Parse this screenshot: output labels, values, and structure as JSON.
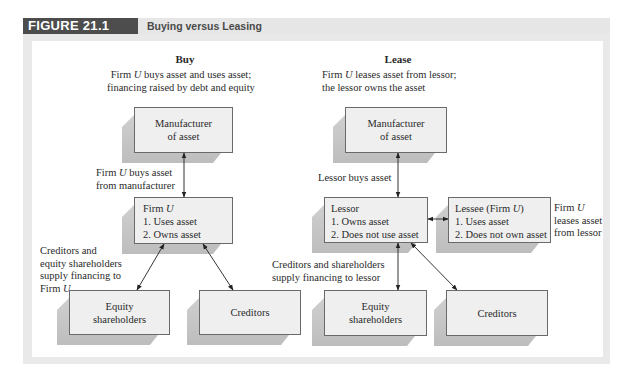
{
  "figure": {
    "label": "FIGURE 21.1",
    "title": "Buying versus Leasing"
  },
  "buy": {
    "heading": "Buy",
    "caption_top": [
      "Firm U buys asset and uses asset;",
      "financing raised by debt and equity"
    ],
    "manufacturer": [
      "Manufacturer",
      "of asset"
    ],
    "arrow_label": [
      "Firm U buys asset",
      "from manufacturer"
    ],
    "firm": [
      "Firm U",
      "1. Uses asset",
      "2. Owns asset"
    ],
    "financing_label": [
      "Creditors and",
      "equity shareholders",
      "supply financing to",
      "Firm U"
    ],
    "equity": [
      "Equity",
      "shareholders"
    ],
    "creditors": "Creditors"
  },
  "lease": {
    "heading": "Lease",
    "caption_top": [
      "Firm U leases asset from lessor;",
      "the lessor owns the asset"
    ],
    "manufacturer": [
      "Manufacturer",
      "of asset"
    ],
    "arrow_label": "Lessor buys asset",
    "lessor": [
      "Lessor",
      "1. Owns asset",
      "2. Does not use asset"
    ],
    "lessee": [
      "Lessee (Firm U)",
      "1. Uses asset",
      "2. Does not own asset"
    ],
    "lessee_label": [
      "Firm U",
      "leases asset",
      "from lessor"
    ],
    "financing_label": [
      "Creditors and shareholders",
      "supply financing to lessor"
    ],
    "equity": [
      "Equity",
      "shareholders"
    ],
    "creditors": "Creditors"
  },
  "colors": {
    "header_dark": "#4d4d4d",
    "header_light": "#e6e6e6",
    "frame": "#e9e9e9",
    "box_fill": "#efefef",
    "box_border": "#6a6a6a",
    "box_shade": "#c6c6c6"
  }
}
